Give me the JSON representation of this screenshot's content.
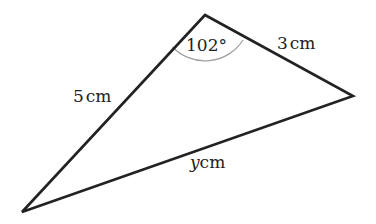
{
  "diagram": {
    "type": "triangle",
    "stroke_color": "#222222",
    "arc_color": "#999999",
    "vertices": {
      "top": [
        205,
        15
      ],
      "right": [
        353,
        96
      ],
      "bottom_left": [
        22,
        212
      ]
    },
    "angle_label": "102°",
    "sides": {
      "left": {
        "value": "5",
        "unit": "cm"
      },
      "top_right": {
        "value": "3",
        "unit": "cm"
      },
      "bottom": {
        "value": "y",
        "unit": "cm"
      }
    }
  }
}
